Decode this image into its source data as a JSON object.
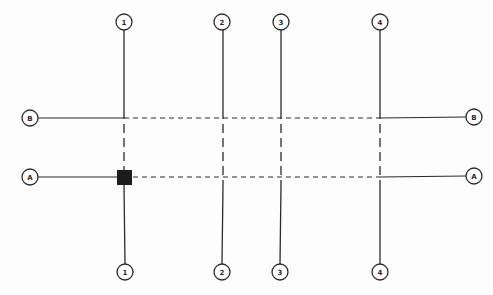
{
  "diagram": {
    "type": "structural-grid-plan",
    "colors": {
      "line": "#2a2a2a",
      "bubble_stroke": "#2a2a2a",
      "bubble_fill": "#ffffff",
      "marker": "#1c1c1c",
      "background": "#fdfdfd"
    },
    "vertical_grid_lines": [
      {
        "label": "1",
        "x": 124
      },
      {
        "label": "2",
        "x": 223
      },
      {
        "label": "3",
        "x": 281
      },
      {
        "label": "4",
        "x": 380
      }
    ],
    "horizontal_grid_lines": [
      {
        "label": "B",
        "y": 118
      },
      {
        "label": "A",
        "y": 177
      }
    ],
    "top_bubbles": [
      {
        "label": "1",
        "x": 124,
        "y": 22
      },
      {
        "label": "2",
        "x": 222,
        "y": 22
      },
      {
        "label": "3",
        "x": 281,
        "y": 22
      },
      {
        "label": "4",
        "x": 380,
        "y": 22
      }
    ],
    "bottom_bubbles": [
      {
        "label": "1",
        "x": 125,
        "y": 272
      },
      {
        "label": "2",
        "x": 222,
        "y": 272
      },
      {
        "label": "3",
        "x": 280,
        "y": 272
      },
      {
        "label": "4",
        "x": 380,
        "y": 272
      }
    ],
    "left_bubbles": [
      {
        "label": "B",
        "x": 30,
        "y": 118
      },
      {
        "label": "A",
        "x": 30,
        "y": 177
      }
    ],
    "right_bubbles": [
      {
        "label": "B",
        "x": 474,
        "y": 117
      },
      {
        "label": "A",
        "x": 474,
        "y": 176
      }
    ],
    "marker": {
      "shape": "filled-square",
      "at_grid": "A/1",
      "x": 117,
      "y": 170,
      "size": 15
    }
  }
}
